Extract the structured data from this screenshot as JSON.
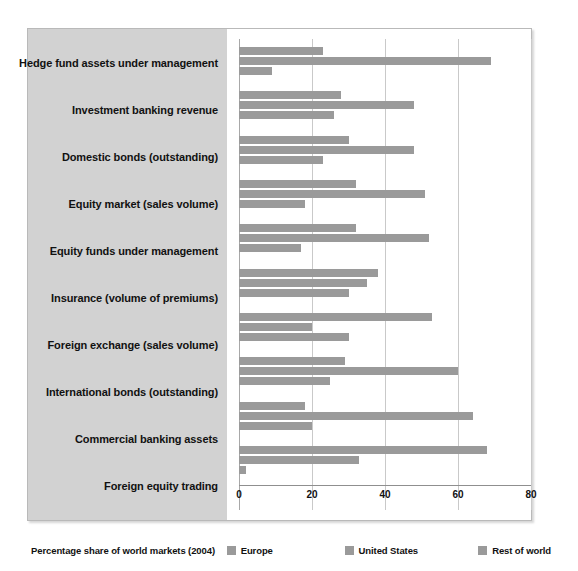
{
  "chart_data": {
    "type": "bar",
    "orientation": "horizontal",
    "title": "",
    "xlabel": "",
    "ylabel": "",
    "xlim": [
      0,
      80
    ],
    "xticks": [
      0,
      20,
      40,
      60,
      80
    ],
    "grid": true,
    "legend_position": "bottom",
    "legend_caption": "Percentage share of world markets (2004)",
    "categories": [
      "Hedge fund assets under management",
      "Investment banking revenue",
      "Domestic bonds (outstanding)",
      "Equity market (sales volume)",
      "Equity funds under management",
      "Insurance (volume of premiums)",
      "Foreign exchange (sales volume)",
      "International bonds (outstanding)",
      "Commercial banking assets",
      "Foreign equity trading"
    ],
    "series": [
      {
        "name": "Europe",
        "color": "#9a9a9a",
        "values": [
          23,
          28,
          30,
          32,
          32,
          38,
          53,
          29,
          18,
          68
        ]
      },
      {
        "name": "United States",
        "color": "#9a9a9a",
        "values": [
          69,
          48,
          48,
          51,
          52,
          35,
          20,
          60,
          64,
          33
        ]
      },
      {
        "name": "Rest of world",
        "color": "#9a9a9a",
        "values": [
          9,
          26,
          23,
          18,
          17,
          30,
          30,
          25,
          20,
          2
        ]
      }
    ]
  },
  "legend": {
    "caption": "Percentage share of world markets (2004)",
    "entries": [
      {
        "label": "Europe"
      },
      {
        "label": "United States"
      },
      {
        "label": "Rest of world"
      }
    ]
  },
  "axis": {
    "ticks": [
      {
        "label": "0"
      },
      {
        "label": "20"
      },
      {
        "label": "40"
      },
      {
        "label": "60"
      },
      {
        "label": "80"
      }
    ]
  }
}
